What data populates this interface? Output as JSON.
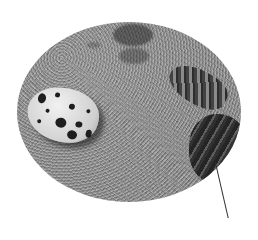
{
  "image": {
    "description": "Grayscale oval-vignetted photograph of a speckled egg resting on sand next to a camouflaged snake, with a thin pointer line extending from the snake downward",
    "subjects": [
      "speckled-egg",
      "sand",
      "camouflaged-snake",
      "pointer-line"
    ],
    "colors": {
      "background": "#ffffff",
      "sand": "#9a9a9a",
      "egg": "#e6e6e6",
      "spots": "#1e1e1e",
      "pointer": "#333333"
    }
  }
}
